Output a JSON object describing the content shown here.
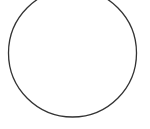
{
  "canvas": {
    "width": 150,
    "height": 129,
    "background": "#ffffff"
  },
  "shape": {
    "type": "circle",
    "cx": 72.5,
    "cy": 53,
    "r": 64,
    "stroke": "#333333",
    "stroke_width": 1.3,
    "fill": "none"
  }
}
